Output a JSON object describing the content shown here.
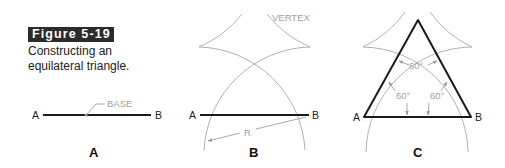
{
  "figure": {
    "number_label": "Figure 5-19",
    "caption": "Constructing an equilateral triangle."
  },
  "panels": [
    {
      "id": "A",
      "label": "A",
      "endpoint_left": "A",
      "endpoint_right": "B",
      "annotations": {
        "base": "BASE"
      }
    },
    {
      "id": "B",
      "label": "B",
      "endpoint_left": "A",
      "endpoint_right": "B",
      "annotations": {
        "vertex": "VERTEX",
        "radius": "R"
      }
    },
    {
      "id": "C",
      "label": "C",
      "endpoint_left": "A",
      "endpoint_right": "B",
      "annotations": {
        "angle_top": "60°",
        "angle_left": "60°",
        "angle_right": "60°"
      }
    }
  ],
  "colors": {
    "badge_bg": "#2b2b2b",
    "line": "#1a1a1a",
    "construction": "#a8a8a8"
  }
}
